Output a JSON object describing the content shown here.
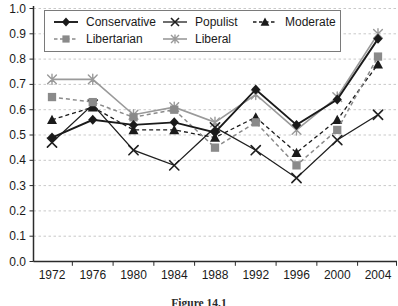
{
  "figure": {
    "caption": "Figure 14.1"
  },
  "chart_data": {
    "type": "line",
    "title": "",
    "xlabel": "",
    "ylabel": "",
    "categories": [
      "1972",
      "1976",
      "1980",
      "1984",
      "1988",
      "1992",
      "1996",
      "2000",
      "2004"
    ],
    "ylim": [
      0.0,
      1.0
    ],
    "ytick_step": 0.1,
    "ytick_labels": [
      "0.0",
      "0.1",
      "0.2",
      "0.3",
      "0.4",
      "0.5",
      "0.6",
      "0.7",
      "0.8",
      "0.9",
      "1.0"
    ],
    "grid": "horizontal-dashed",
    "legend_position": "top-inside-boxed",
    "legend_rows": [
      [
        "Conservative",
        "Populist",
        "Moderate"
      ],
      [
        "Libertarian",
        "Liberal"
      ]
    ],
    "draw_order": [
      "Liberal",
      "Populist",
      "Moderate",
      "Libertarian",
      "Conservative"
    ],
    "series": [
      {
        "name": "Conservative",
        "marker": "diamond",
        "line_style": "solid",
        "color": "#1a1a1a",
        "values": [
          0.49,
          0.56,
          0.54,
          0.55,
          0.51,
          0.68,
          0.54,
          0.64,
          0.88
        ]
      },
      {
        "name": "Libertarian",
        "marker": "square",
        "line_style": "dashed",
        "color": "#8a8a8a",
        "values": [
          0.65,
          0.63,
          0.57,
          0.6,
          0.45,
          0.55,
          0.38,
          0.52,
          0.81
        ]
      },
      {
        "name": "Populist",
        "marker": "x",
        "line_style": "solid",
        "color": "#1f1f1f",
        "values": [
          0.47,
          0.62,
          0.44,
          0.38,
          0.53,
          0.44,
          0.33,
          0.48,
          0.58
        ]
      },
      {
        "name": "Liberal",
        "marker": "asterisk",
        "line_style": "solid",
        "color": "#9a9a9a",
        "values": [
          0.72,
          0.72,
          0.58,
          0.61,
          0.55,
          0.66,
          0.52,
          0.65,
          0.9
        ]
      },
      {
        "name": "Moderate",
        "marker": "triangle",
        "line_style": "dashed",
        "color": "#1a1a1a",
        "values": [
          0.56,
          0.61,
          0.52,
          0.52,
          0.49,
          0.57,
          0.43,
          0.56,
          0.78
        ]
      }
    ]
  }
}
